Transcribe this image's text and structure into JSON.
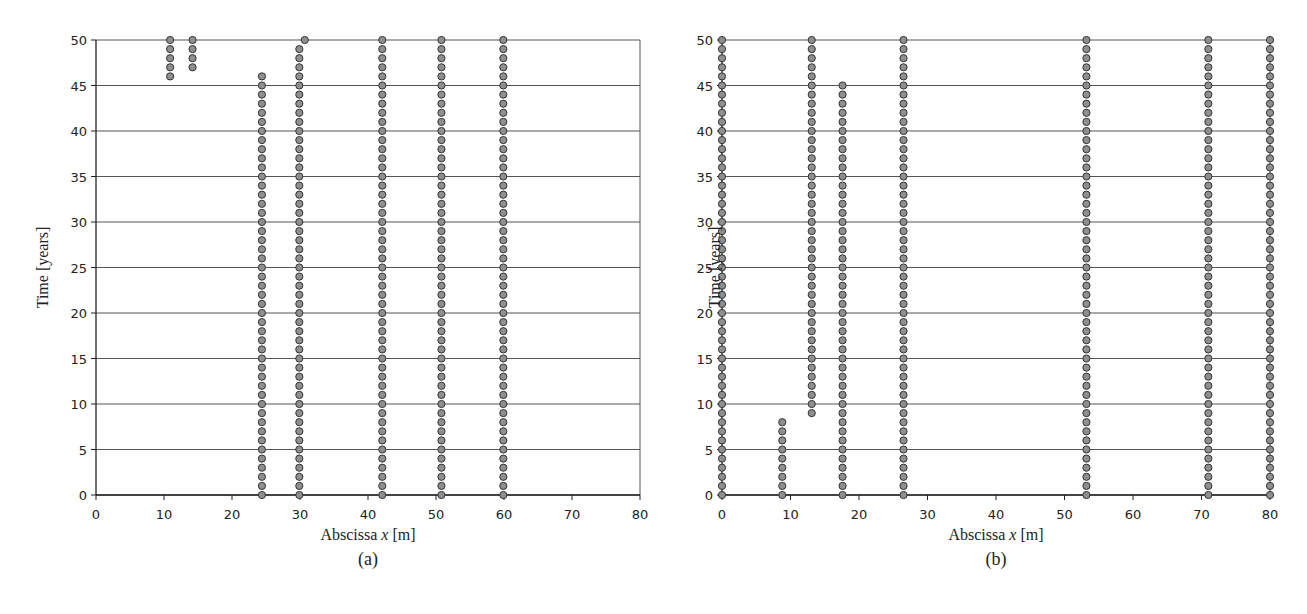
{
  "figure": {
    "panels": [
      {
        "id": "a",
        "panel_label": "(a)",
        "xlabel_prefix": "Abscissa ",
        "xlabel_var": "x",
        "xlabel_suffix": " [m]",
        "ylabel": "Time  [years]"
      },
      {
        "id": "b",
        "panel_label": "(b)",
        "xlabel_prefix": "Abscissa ",
        "xlabel_var": "x",
        "xlabel_suffix": " [m]",
        "ylabel": "Time  [years]"
      }
    ],
    "colors": {
      "marker_fill": "#8f8f8f",
      "marker_stroke": "#333333",
      "grid": "#555555",
      "axis": "#222222"
    }
  },
  "chart_data": [
    {
      "type": "scatter",
      "panel": "(a)",
      "title": "",
      "xlabel": "Abscissa x [m]",
      "ylabel": "Time [years]",
      "xlim": [
        0,
        80
      ],
      "ylim": [
        0,
        50
      ],
      "xticks": [
        0,
        10,
        20,
        30,
        40,
        50,
        60,
        70,
        80
      ],
      "yticks": [
        0,
        5,
        10,
        15,
        20,
        25,
        30,
        35,
        40,
        45,
        50
      ],
      "grid": "horizontal",
      "legend": null,
      "columns": [
        {
          "x": 10.9,
          "t_from": 46,
          "t_to": 50
        },
        {
          "x": 14.2,
          "t_from": 47,
          "t_to": 50
        },
        {
          "x": 24.4,
          "t_from": 0,
          "t_to": 46
        },
        {
          "x": 29.9,
          "t_from": 0,
          "t_to": 49
        },
        {
          "x": 30.7,
          "t_from": 50,
          "t_to": 50
        },
        {
          "x": 42.1,
          "t_from": 0,
          "t_to": 50
        },
        {
          "x": 50.8,
          "t_from": 0,
          "t_to": 50
        },
        {
          "x": 59.9,
          "t_from": 0,
          "t_to": 50
        }
      ],
      "time_step": 1
    },
    {
      "type": "scatter",
      "panel": "(b)",
      "title": "",
      "xlabel": "Abscissa x [m]",
      "ylabel": "Time [years]",
      "xlim": [
        0,
        80
      ],
      "ylim": [
        0,
        50
      ],
      "xticks": [
        0,
        10,
        20,
        30,
        40,
        50,
        60,
        70,
        80
      ],
      "yticks": [
        0,
        5,
        10,
        15,
        20,
        25,
        30,
        35,
        40,
        45,
        50
      ],
      "grid": "horizontal",
      "legend": null,
      "columns": [
        {
          "x": 0.0,
          "t_from": 0,
          "t_to": 50
        },
        {
          "x": 8.8,
          "t_from": 0,
          "t_to": 8
        },
        {
          "x": 13.1,
          "t_from": 9,
          "t_to": 50
        },
        {
          "x": 17.6,
          "t_from": 0,
          "t_to": 45
        },
        {
          "x": 26.5,
          "t_from": 0,
          "t_to": 50
        },
        {
          "x": 53.2,
          "t_from": 0,
          "t_to": 50
        },
        {
          "x": 71.0,
          "t_from": 0,
          "t_to": 50
        },
        {
          "x": 80.0,
          "t_from": 0,
          "t_to": 50
        }
      ],
      "time_step": 1
    }
  ]
}
